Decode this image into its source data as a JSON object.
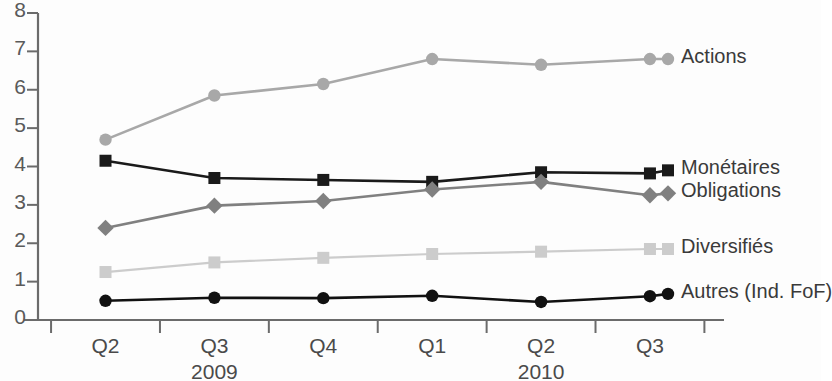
{
  "chart_data": {
    "type": "line",
    "title": "",
    "subtitle": "",
    "xlabel": "",
    "ylabel": "",
    "categories": [
      "Q2",
      "Q3",
      "Q4",
      "Q1",
      "Q2",
      "Q3"
    ],
    "year_groups": [
      {
        "label": "2009",
        "center_category_index": 1
      },
      {
        "label": "2010",
        "center_category_index": 4
      }
    ],
    "ylim": [
      0,
      8
    ],
    "ytick_labels": [
      "0",
      "1",
      "2",
      "3",
      "4",
      "5",
      "6",
      "7",
      "8"
    ],
    "ytick_values": [
      0,
      1,
      2,
      3,
      4,
      5,
      6,
      7,
      8
    ],
    "grid": false,
    "legend_position": "right-inline",
    "series": [
      {
        "name": "Actions",
        "values": [
          4.7,
          5.85,
          6.15,
          6.8,
          6.65,
          6.8
        ],
        "color": "#a8a8a8",
        "marker": "circle",
        "label_y_value": 6.8
      },
      {
        "name": "Monétaires",
        "values": [
          4.15,
          3.7,
          3.65,
          3.6,
          3.85,
          3.82
        ],
        "color": "#1a1a1a",
        "marker": "square",
        "label_y_value": 3.9
      },
      {
        "name": "Obligations",
        "values": [
          2.4,
          2.98,
          3.1,
          3.4,
          3.6,
          3.25
        ],
        "color": "#808080",
        "marker": "diamond",
        "label_y_value": 3.3
      },
      {
        "name": "Diversifiés",
        "values": [
          1.25,
          1.5,
          1.62,
          1.72,
          1.78,
          1.85
        ],
        "color": "#cccccc",
        "marker": "square",
        "label_y_value": 1.85
      },
      {
        "name": "Autres (Ind. FoF)",
        "values": [
          0.5,
          0.58,
          0.57,
          0.63,
          0.47,
          0.62
        ],
        "color": "#111111",
        "marker": "circle",
        "label_y_value": 0.68
      }
    ],
    "axis_color": "#6b6b6b"
  }
}
